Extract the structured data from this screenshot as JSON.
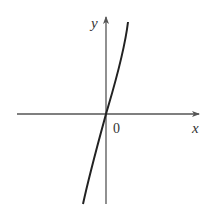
{
  "figure": {
    "axes": {
      "x_label": "x",
      "y_label": "y",
      "origin_label": "0"
    },
    "curve": {
      "description": "increasing curve passing through origin, steep, slightly concave up for x>0 and concave down for x<0",
      "color": "#222222"
    },
    "colors": {
      "axis": "#555555",
      "curve": "#222222",
      "background": "#ffffff"
    }
  }
}
